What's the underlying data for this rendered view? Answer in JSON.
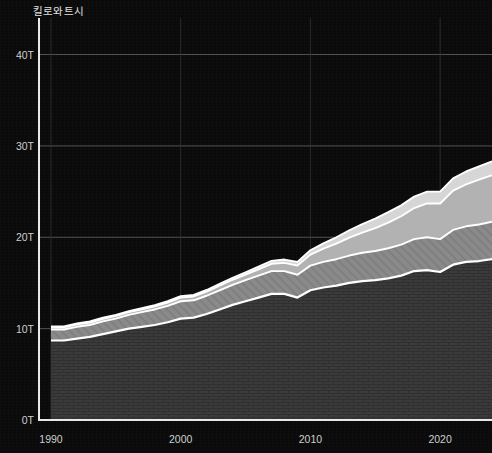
{
  "chart_data": {
    "type": "area",
    "stacked": true,
    "title": "",
    "subtitle": "",
    "xlabel": "",
    "ylabel": "킬로와트시",
    "ylim": [
      0,
      44
    ],
    "xlim": [
      1989,
      2024
    ],
    "y_unit": "T",
    "grid": true,
    "legend_position": "none",
    "y_ticks": [
      {
        "value": 0,
        "label": "0T"
      },
      {
        "value": 10,
        "label": "10T"
      },
      {
        "value": 20,
        "label": "20T"
      },
      {
        "value": 30,
        "label": "30T"
      },
      {
        "value": 40,
        "label": "40T"
      }
    ],
    "x_ticks": [
      {
        "value": 1990,
        "label": "1990"
      },
      {
        "value": 2000,
        "label": "2000"
      },
      {
        "value": 2010,
        "label": "2010"
      },
      {
        "value": 2020,
        "label": "2020"
      }
    ],
    "x": [
      1990,
      1991,
      1992,
      1993,
      1994,
      1995,
      1996,
      1997,
      1998,
      1999,
      2000,
      2001,
      2002,
      2003,
      2004,
      2005,
      2006,
      2007,
      2008,
      2009,
      2010,
      2011,
      2012,
      2013,
      2014,
      2015,
      2016,
      2017,
      2018,
      2019,
      2020,
      2021,
      2022,
      2023,
      2024
    ],
    "series": [
      {
        "name": "series-1",
        "color": "#3a3a3a",
        "texture": "brick",
        "values": [
          8.7,
          8.7,
          8.9,
          9.1,
          9.4,
          9.7,
          10.0,
          10.2,
          10.4,
          10.7,
          11.1,
          11.2,
          11.6,
          12.1,
          12.6,
          13.0,
          13.4,
          13.8,
          13.8,
          13.4,
          14.2,
          14.5,
          14.7,
          15.0,
          15.2,
          15.3,
          15.5,
          15.8,
          16.3,
          16.4,
          16.2,
          17.0,
          17.3,
          17.4,
          17.6
        ]
      },
      {
        "name": "series-2",
        "color": "#878787",
        "texture": "diagonal-hatch",
        "values": [
          1.2,
          1.2,
          1.3,
          1.3,
          1.4,
          1.4,
          1.5,
          1.6,
          1.7,
          1.8,
          1.9,
          1.9,
          2.0,
          2.1,
          2.2,
          2.3,
          2.4,
          2.5,
          2.5,
          2.5,
          2.7,
          2.8,
          2.9,
          3.0,
          3.1,
          3.2,
          3.3,
          3.4,
          3.5,
          3.6,
          3.6,
          3.8,
          3.9,
          4.0,
          4.1
        ]
      },
      {
        "name": "series-3",
        "color": "#b2b2b2",
        "texture": "solid",
        "values": [
          0.25,
          0.25,
          0.26,
          0.27,
          0.28,
          0.29,
          0.3,
          0.32,
          0.34,
          0.36,
          0.4,
          0.42,
          0.45,
          0.5,
          0.55,
          0.62,
          0.7,
          0.8,
          0.9,
          1.0,
          1.2,
          1.45,
          1.7,
          1.95,
          2.2,
          2.5,
          2.8,
          3.1,
          3.4,
          3.7,
          3.9,
          4.3,
          4.6,
          4.9,
          5.1
        ]
      },
      {
        "name": "series-4",
        "color": "#d6d6d6",
        "texture": "solid",
        "values": [
          0.1,
          0.1,
          0.1,
          0.11,
          0.11,
          0.12,
          0.12,
          0.13,
          0.14,
          0.15,
          0.16,
          0.17,
          0.18,
          0.2,
          0.22,
          0.25,
          0.28,
          0.32,
          0.36,
          0.4,
          0.48,
          0.58,
          0.7,
          0.82,
          0.95,
          1.05,
          1.15,
          1.2,
          1.25,
          1.3,
          1.3,
          1.35,
          1.4,
          1.45,
          1.5
        ]
      }
    ],
    "totals_note": "",
    "stroke_color": "#ffffff"
  },
  "axis": {
    "y_title": "킬로와트시"
  },
  "colors": {
    "background": "#0a0a0a",
    "axis": "#e9e9e9",
    "gridline": "#5a5a5a",
    "tick_text": "#cfcfcf"
  }
}
